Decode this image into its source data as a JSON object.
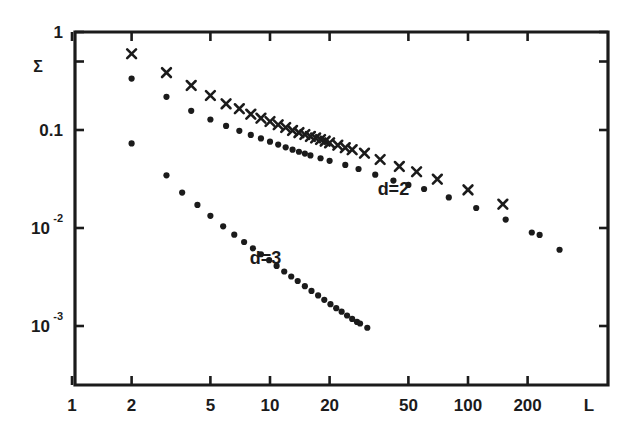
{
  "figure": {
    "title": "",
    "sigma_label": "Σ",
    "x_axis_name": "L",
    "frame_color": "#1b1b1b",
    "marker_color": "#1b1b1b"
  },
  "chart_data": {
    "type": "scatter",
    "title": "",
    "xlabel": "L",
    "ylabel": "Σ",
    "xscale": "log",
    "yscale": "log",
    "xlim": [
      1,
      320
    ],
    "ylim": [
      0.0007,
      1
    ],
    "grid": false,
    "legend_position": "inline-annotation",
    "xticks": [
      1,
      2,
      5,
      10,
      20,
      50,
      100,
      200
    ],
    "xtick_labels": [
      "1",
      "2",
      "5",
      "10",
      "20",
      "50",
      "100",
      "200"
    ],
    "yticks": [
      1,
      0.5,
      0.1,
      0.01,
      0.001
    ],
    "ytick_labels": [
      "1",
      "",
      "0.1",
      "10⁻²",
      "10⁻³"
    ],
    "ytick_labels_detail": [
      {
        "value": 1,
        "text": "1",
        "sup": ""
      },
      {
        "value": 0.5,
        "text": "",
        "sup": ""
      },
      {
        "value": 0.1,
        "text": "0.1",
        "sup": ""
      },
      {
        "value": 0.01,
        "text": "10",
        "sup": "-2"
      },
      {
        "value": 0.001,
        "text": "10",
        "sup": "-3"
      }
    ],
    "annotations": [
      {
        "text": "d=2",
        "x": 42,
        "y": 0.0215
      },
      {
        "text": "d=3",
        "x": 9.5,
        "y": 0.0043
      }
    ],
    "series": [
      {
        "name": "d=2",
        "marker": "cross",
        "label": "d=2",
        "points": [
          [
            2.0,
            0.6
          ],
          [
            3.0,
            0.385
          ],
          [
            4.0,
            0.285
          ],
          [
            5.0,
            0.225
          ],
          [
            6.0,
            0.185
          ],
          [
            7.0,
            0.165
          ],
          [
            8.0,
            0.145
          ],
          [
            9.0,
            0.132
          ],
          [
            10.0,
            0.122
          ],
          [
            11.0,
            0.113
          ],
          [
            12.0,
            0.106
          ],
          [
            13.0,
            0.099
          ],
          [
            14.0,
            0.094
          ],
          [
            15.0,
            0.09
          ],
          [
            16.0,
            0.086
          ],
          [
            17.0,
            0.083
          ],
          [
            18.0,
            0.08
          ],
          [
            19.0,
            0.077
          ],
          [
            20.0,
            0.074
          ],
          [
            22.0,
            0.07
          ],
          [
            24.0,
            0.066
          ],
          [
            26.0,
            0.063
          ],
          [
            30.0,
            0.058
          ],
          [
            36.0,
            0.05
          ],
          [
            45.0,
            0.0425
          ],
          [
            55.0,
            0.0375
          ],
          [
            70.0,
            0.0315
          ],
          [
            100.0,
            0.0245
          ],
          [
            150.0,
            0.0175
          ]
        ]
      },
      {
        "name": "d=3",
        "marker": "dot",
        "label": "d=3",
        "points": [
          [
            2.0,
            0.335
          ],
          [
            3.0,
            0.218
          ],
          [
            4.0,
            0.157
          ],
          [
            5.0,
            0.128
          ],
          [
            6.0,
            0.11
          ],
          [
            7.0,
            0.098
          ],
          [
            8.0,
            0.089
          ],
          [
            9.0,
            0.082
          ],
          [
            10.0,
            0.076
          ],
          [
            11.0,
            0.071
          ],
          [
            12.0,
            0.0665
          ],
          [
            13.0,
            0.063
          ],
          [
            14.0,
            0.06
          ],
          [
            15.0,
            0.0575
          ],
          [
            16.0,
            0.055
          ],
          [
            18.0,
            0.0515
          ],
          [
            20.0,
            0.0485
          ],
          [
            24.0,
            0.044
          ],
          [
            28.0,
            0.04
          ],
          [
            34.0,
            0.035
          ],
          [
            42.0,
            0.0305
          ],
          [
            50.0,
            0.0275
          ],
          [
            60.0,
            0.025
          ],
          [
            80.0,
            0.0205
          ],
          [
            110.0,
            0.016
          ],
          [
            155.0,
            0.0122
          ],
          [
            210.0,
            0.009
          ],
          [
            230.0,
            0.0085
          ],
          [
            290.0,
            0.006
          ]
        ]
      },
      {
        "name": "d=3-steep",
        "marker": "dot",
        "label": "d=3",
        "points": [
          [
            2.0,
            0.073
          ],
          [
            3.0,
            0.0345
          ],
          [
            3.6,
            0.023
          ],
          [
            4.3,
            0.0172
          ],
          [
            5.0,
            0.0133
          ],
          [
            5.8,
            0.0104
          ],
          [
            6.6,
            0.00855
          ],
          [
            7.4,
            0.0072
          ],
          [
            8.2,
            0.0062
          ],
          [
            9.0,
            0.0054
          ],
          [
            9.9,
            0.0047
          ],
          [
            10.8,
            0.0041
          ],
          [
            11.8,
            0.0036
          ],
          [
            12.8,
            0.0032
          ],
          [
            13.8,
            0.00288
          ],
          [
            15.0,
            0.00255
          ],
          [
            16.2,
            0.00228
          ],
          [
            17.5,
            0.00205
          ],
          [
            18.8,
            0.00185
          ],
          [
            20.2,
            0.00167
          ],
          [
            21.6,
            0.00152
          ],
          [
            23.0,
            0.0014
          ],
          [
            24.5,
            0.00128
          ],
          [
            26.0,
            0.00118
          ],
          [
            27.5,
            0.0011
          ],
          [
            28.5,
            0.00106
          ],
          [
            31.0,
            0.00096
          ]
        ]
      }
    ]
  }
}
